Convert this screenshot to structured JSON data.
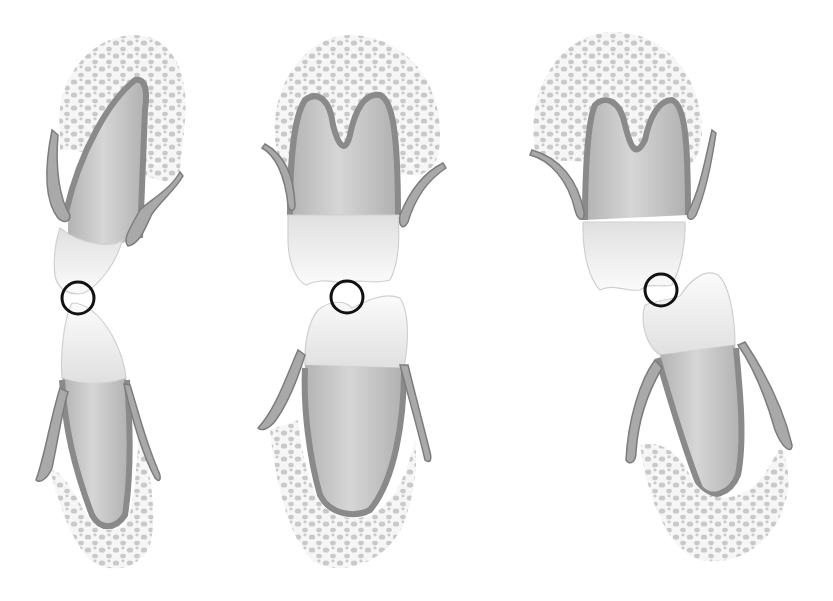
{
  "figure": {
    "palette": {
      "background": "#ffffff",
      "bone_dots": "#b9b9b9",
      "root": "#bdbdbd",
      "crown": "#f6f6f6",
      "ligament": "#8a8a8a",
      "contact_circle": "#111111"
    },
    "panels": [
      {
        "id": "left",
        "upper_tooth": "single-root anterior tooth, tilted",
        "lower_tooth": "single-root anterior tooth",
        "contact_circle": {
          "cx": 78,
          "cy": 298,
          "r": 16
        }
      },
      {
        "id": "middle",
        "upper_tooth": "two-root molar",
        "lower_tooth": "single-root premolar",
        "contact_circle": {
          "cx": 347,
          "cy": 297,
          "r": 16
        }
      },
      {
        "id": "right",
        "upper_tooth": "two-root molar",
        "lower_tooth": "single-root premolar, offset",
        "contact_circle": {
          "cx": 661,
          "cy": 290,
          "r": 16
        }
      }
    ]
  }
}
